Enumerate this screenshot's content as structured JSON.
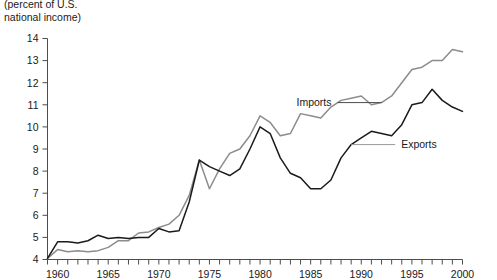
{
  "axis_caption": "(percent of U.S.\nnational income)",
  "chart_data": {
    "type": "line",
    "title": "",
    "subtitle": "",
    "xlabel": "",
    "ylabel": "(percent of U.S. national income)",
    "xlim": [
      1959,
      2000
    ],
    "ylim": [
      4,
      14
    ],
    "yticks": [
      4,
      5,
      6,
      7,
      8,
      9,
      10,
      11,
      12,
      13,
      14
    ],
    "ytick_labels": [
      "4",
      "5",
      "6",
      "7",
      "8",
      "9",
      "10",
      "11",
      "12",
      "13",
      "14"
    ],
    "xticks": [
      1959,
      1960,
      1961,
      1962,
      1963,
      1964,
      1965,
      1966,
      1967,
      1968,
      1969,
      1970,
      1971,
      1972,
      1973,
      1974,
      1975,
      1976,
      1977,
      1978,
      1979,
      1980,
      1981,
      1982,
      1983,
      1984,
      1985,
      1986,
      1987,
      1988,
      1989,
      1990,
      1991,
      1992,
      1993,
      1994,
      1995,
      1996,
      1997,
      1998,
      1999,
      2000
    ],
    "xtick_labels": [
      {
        "value": 1960,
        "label": "1960"
      },
      {
        "value": 1965,
        "label": "1965"
      },
      {
        "value": 1970,
        "label": "1970"
      },
      {
        "value": 1975,
        "label": "1975"
      },
      {
        "value": 1980,
        "label": "1980"
      },
      {
        "value": 1985,
        "label": "1985"
      },
      {
        "value": 1990,
        "label": "1990"
      },
      {
        "value": 1995,
        "label": "1995"
      },
      {
        "value": 2000,
        "label": "2000"
      }
    ],
    "grid": false,
    "legend_position": "inline-annotations",
    "x": [
      1959,
      1960,
      1961,
      1962,
      1963,
      1964,
      1965,
      1966,
      1967,
      1968,
      1969,
      1970,
      1971,
      1972,
      1973,
      1974,
      1975,
      1976,
      1977,
      1978,
      1979,
      1980,
      1981,
      1982,
      1983,
      1984,
      1985,
      1986,
      1987,
      1988,
      1989,
      1990,
      1991,
      1992,
      1993,
      1994,
      1995,
      1996,
      1997,
      1998,
      1999,
      2000
    ],
    "series": [
      {
        "name": "Imports",
        "color": "#8c8c8c",
        "values": [
          4.05,
          4.45,
          4.35,
          4.4,
          4.35,
          4.4,
          4.55,
          4.85,
          4.85,
          5.2,
          5.25,
          5.45,
          5.6,
          6.0,
          6.9,
          8.5,
          7.2,
          8.1,
          8.8,
          9.0,
          9.6,
          10.5,
          10.2,
          9.6,
          9.7,
          10.6,
          10.5,
          10.4,
          10.9,
          11.2,
          11.3,
          11.4,
          11.0,
          11.1,
          11.4,
          12.0,
          12.6,
          12.7,
          13.0,
          13.0,
          13.5,
          13.4
        ]
      },
      {
        "name": "Exports",
        "color": "#1a1a1a",
        "values": [
          4.05,
          4.8,
          4.8,
          4.75,
          4.85,
          5.1,
          4.95,
          5.0,
          4.95,
          5.0,
          5.0,
          5.4,
          5.25,
          5.3,
          6.6,
          8.5,
          8.2,
          8.0,
          7.8,
          8.1,
          9.0,
          10.0,
          9.7,
          8.6,
          7.9,
          7.7,
          7.2,
          7.2,
          7.6,
          8.6,
          9.2,
          9.5,
          9.8,
          9.7,
          9.6,
          10.1,
          11.0,
          11.1,
          11.7,
          11.2,
          10.9,
          10.7
        ]
      }
    ],
    "annotations": [
      {
        "text": "Imports",
        "target_series": "Imports",
        "at_x": 1992,
        "at_y": 11.1
      },
      {
        "text": "Exports",
        "target_series": "Exports",
        "at_x": 1989,
        "at_y": 9.2
      }
    ]
  }
}
